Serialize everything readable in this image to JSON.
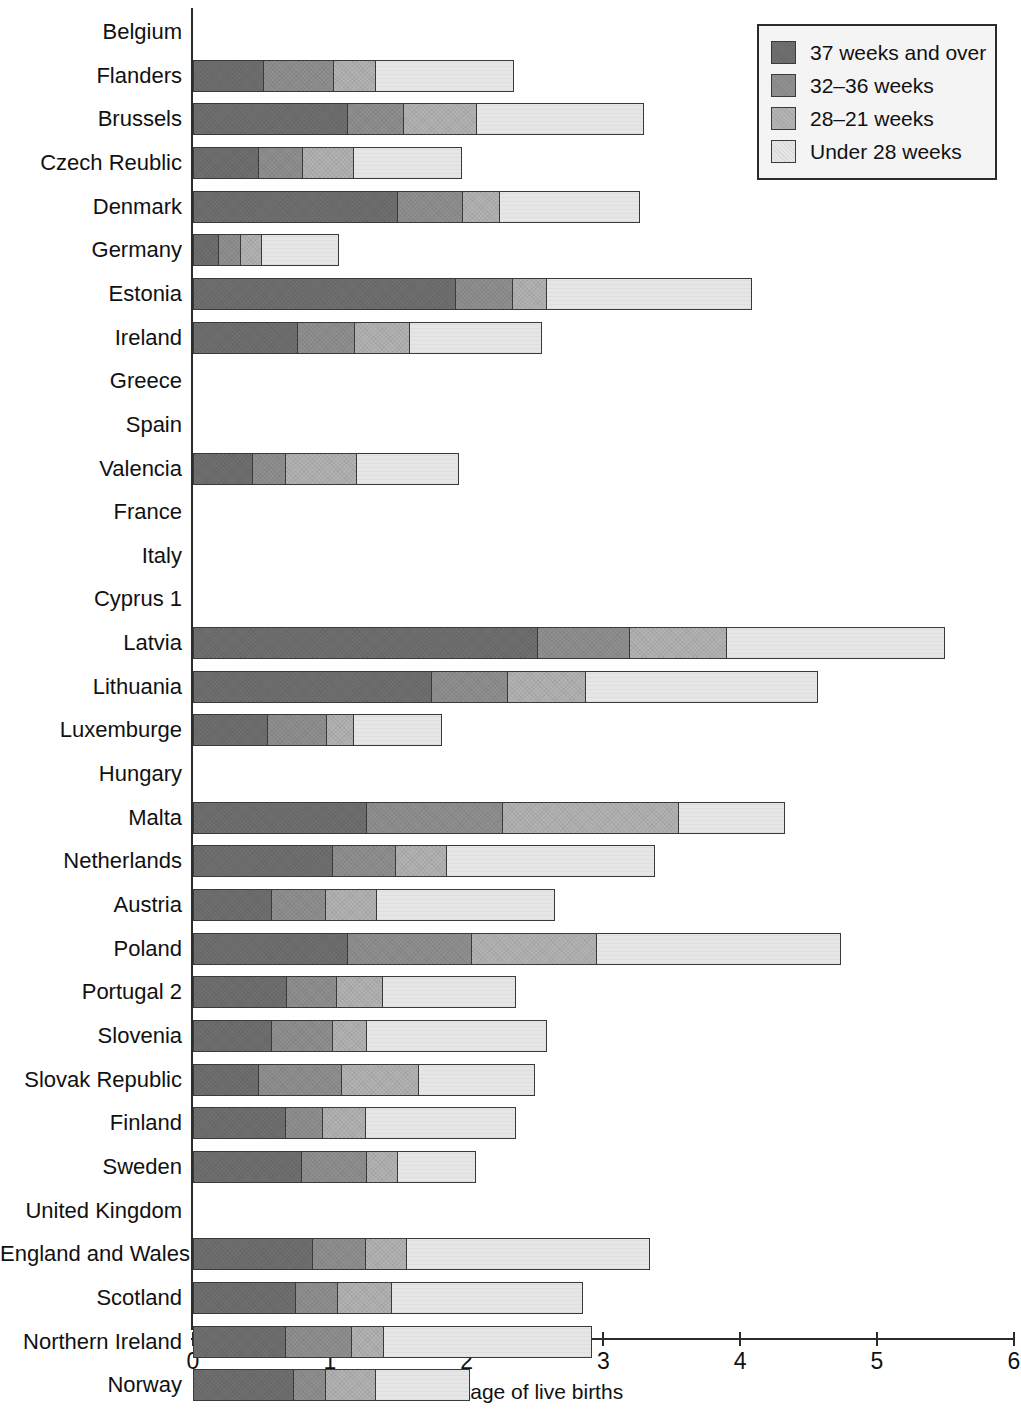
{
  "chart_data": {
    "type": "bar",
    "orientation": "horizontal",
    "stacked": true,
    "title": "",
    "xlabel": "Percentage of live births",
    "ylabel": "",
    "xlim": [
      0,
      6
    ],
    "xticks": [
      0,
      1,
      2,
      3,
      4,
      5,
      6
    ],
    "xtick_labels": [
      "0",
      "1",
      "2",
      "3",
      "4",
      "5",
      "6"
    ],
    "grid": false,
    "legend_position": "top-right",
    "series": [
      {
        "name": "37 weeks and over",
        "color": "#6f6f6f",
        "values": [
          null,
          0.52,
          1.13,
          0.48,
          1.5,
          0.19,
          1.92,
          0.77,
          null,
          null,
          0.44,
          null,
          null,
          null,
          2.52,
          1.75,
          0.55,
          null,
          1.27,
          1.02,
          0.58,
          1.13,
          0.69,
          0.58,
          0.48,
          0.68,
          0.8,
          null,
          0.88,
          0.75,
          0.68,
          0.74
        ]
      },
      {
        "name": "32–36 weeks",
        "color": "#8f8f8f",
        "values": [
          null,
          0.52,
          0.42,
          0.33,
          0.48,
          0.17,
          0.43,
          0.42,
          null,
          null,
          0.25,
          null,
          null,
          null,
          0.68,
          0.56,
          0.44,
          null,
          1.0,
          0.47,
          0.4,
          0.92,
          0.37,
          0.45,
          0.62,
          0.28,
          0.48,
          null,
          0.39,
          0.32,
          0.49,
          0.24
        ]
      },
      {
        "name": "28–21 weeks",
        "color": "#b2b2b2",
        "values": [
          null,
          0.31,
          0.54,
          0.38,
          0.28,
          0.16,
          0.25,
          0.41,
          null,
          null,
          0.52,
          null,
          null,
          null,
          0.72,
          0.58,
          0.2,
          null,
          1.3,
          0.38,
          0.38,
          0.92,
          0.34,
          0.26,
          0.57,
          0.32,
          0.23,
          null,
          0.31,
          0.4,
          0.24,
          0.37
        ]
      },
      {
        "name": "Under 28 weeks",
        "color": "#e6e6e6",
        "values": [
          null,
          1.02,
          1.23,
          0.8,
          1.03,
          0.57,
          1.51,
          0.97,
          null,
          null,
          0.76,
          null,
          null,
          null,
          1.6,
          1.7,
          0.65,
          null,
          0.78,
          1.53,
          1.31,
          1.79,
          0.98,
          1.32,
          0.85,
          1.1,
          0.58,
          null,
          1.78,
          1.4,
          1.53,
          0.7
        ]
      }
    ],
    "categories": [
      "Belgium",
      "Flanders",
      "Brussels",
      "Czech Reublic",
      "Denmark",
      "Germany",
      "Estonia",
      "Ireland",
      "Greece",
      "Spain",
      "Valencia",
      "France",
      "Italy",
      "Cyprus 1",
      "Latvia",
      "Lithuania",
      "Luxemburge",
      "Hungary",
      "Malta",
      "Netherlands",
      "Austria",
      "Poland",
      "Portugal 2",
      "Slovenia",
      "Slovak Republic",
      "Finland",
      "Sweden",
      "United Kingdom",
      "England and Wales 3",
      "Scotland",
      "Northern Ireland",
      "Norway"
    ],
    "totals": [
      null,
      2.37,
      3.32,
      1.99,
      3.29,
      1.09,
      4.11,
      2.57,
      null,
      null,
      1.97,
      null,
      null,
      null,
      5.52,
      4.59,
      1.84,
      null,
      4.35,
      3.4,
      2.67,
      4.76,
      2.38,
      2.61,
      2.52,
      2.38,
      2.09,
      null,
      3.36,
      2.87,
      2.94,
      2.05
    ]
  },
  "legend": {
    "items": [
      {
        "label": "37 weeks and over",
        "color": "#6f6f6f"
      },
      {
        "label": "32–36 weeks",
        "color": "#8f8f8f"
      },
      {
        "label": "28–21 weeks",
        "color": "#b2b2b2"
      },
      {
        "label": "Under 28 weeks",
        "color": "#e6e6e6"
      }
    ]
  },
  "axis": {
    "x_title": "Percentage of live births"
  }
}
